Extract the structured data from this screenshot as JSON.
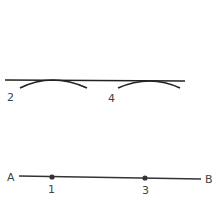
{
  "diagram": {
    "top_line": {
      "x1": 5,
      "y1": 80,
      "x2": 185,
      "y2": 81
    },
    "arcs": [
      {
        "label": "2",
        "path": "M20 88 Q52 72 87 88",
        "label_x": 7,
        "label_y": 101
      },
      {
        "label": "4",
        "path": "M118 88 Q150 74 180 88",
        "label_x": 108,
        "label_y": 102
      }
    ],
    "segment": {
      "start_label": "A",
      "end_label": "B",
      "x1": 19,
      "y1": 176,
      "x2": 201,
      "y2": 179,
      "start_label_x": 7,
      "start_label_y": 181,
      "end_label_x": 205,
      "end_label_y": 183
    },
    "points": [
      {
        "label": "1",
        "x": 52,
        "y": 177,
        "label_x": 48,
        "label_y": 193
      },
      {
        "label": "3",
        "x": 145,
        "y": 178,
        "label_x": 142,
        "label_y": 194
      }
    ],
    "stroke_color": "#222222"
  }
}
